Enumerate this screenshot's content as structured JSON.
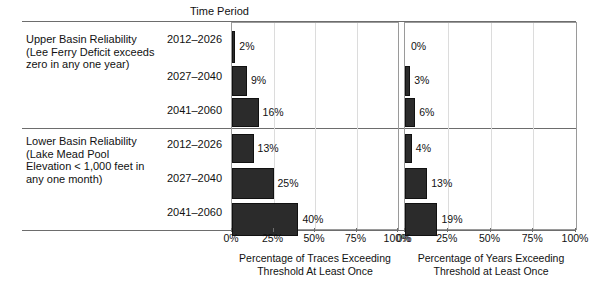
{
  "table": {
    "column_header": "Time Period",
    "groups": [
      {
        "name": "upper-basin",
        "label": "Upper Basin Reliability\n(Lee Ferry Deficit exceeds\nzero in any one year)",
        "periods": [
          "2012–2026",
          "2027–2040",
          "2041–2060"
        ]
      },
      {
        "name": "lower-basin",
        "label": "Lower Basin Reliability\n(Lake Mead Pool\nElevation  < 1,000 feet in\nany one month)",
        "periods": [
          "2012–2026",
          "2027–2040",
          "2041–2060"
        ]
      }
    ]
  },
  "chart_data": [
    {
      "type": "bar",
      "name": "traces-exceeding",
      "orientation": "horizontal",
      "title": "",
      "xlabel": "Percentage of Traces Exceeding\nThreshold At Least Once",
      "ylabel": "",
      "xlim": [
        0,
        100
      ],
      "xticks": [
        0,
        25,
        50,
        75,
        100
      ],
      "xticklabels": [
        "0%",
        "25%",
        "50%",
        "75%",
        "100%"
      ],
      "grid": true,
      "categories": [
        "2012–2026",
        "2027–2040",
        "2041–2060",
        "2012–2026",
        "2027–2040",
        "2041–2060"
      ],
      "values": [
        2,
        9,
        16,
        13,
        25,
        40
      ],
      "value_labels": [
        "2%",
        "9%",
        "16%",
        "13%",
        "25%",
        "40%"
      ],
      "bar_color": "#2b2b2b"
    },
    {
      "type": "bar",
      "name": "years-exceeding",
      "orientation": "horizontal",
      "title": "",
      "xlabel": "Percentage of Years Exceeding\nThreshold at Least Once",
      "ylabel": "",
      "xlim": [
        0,
        100
      ],
      "xticks": [
        0,
        25,
        50,
        75,
        100
      ],
      "xticklabels": [
        "0%",
        "25%",
        "50%",
        "75%",
        "100%"
      ],
      "grid": true,
      "categories": [
        "2012–2026",
        "2027–2040",
        "2041–2060",
        "2012–2026",
        "2027–2040",
        "2041–2060"
      ],
      "values": [
        0,
        3,
        6,
        4,
        13,
        19
      ],
      "value_labels": [
        "0%",
        "3%",
        "6%",
        "4%",
        "13%",
        "19%"
      ],
      "bar_color": "#2b2b2b"
    }
  ]
}
